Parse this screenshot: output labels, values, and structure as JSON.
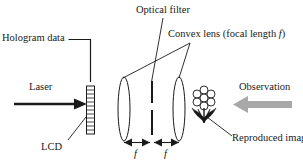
{
  "figure": {
    "title_labels": {
      "hologram_data": "Hologram data",
      "laser": "Laser",
      "lcd": "LCD",
      "optical_filter": "Optical filter",
      "convex_lens_prefix": "Convex lens (focal length ",
      "convex_lens_italic": "f",
      "convex_lens_suffix": ")",
      "observation": "Observation",
      "reproduced_image": "Reproduced image",
      "focal_1": "f",
      "focal_2": "f"
    },
    "colors": {
      "stroke": "#1a1a1a",
      "text": "#1a1a1a",
      "observation_arrow": "#a8a8a8",
      "lcd_fill": "#ffffff",
      "background": "#ffffff"
    },
    "components": {
      "lcd_segments": 12,
      "lens_count": 2,
      "filter_gap": true,
      "flower_petals": 7
    }
  }
}
